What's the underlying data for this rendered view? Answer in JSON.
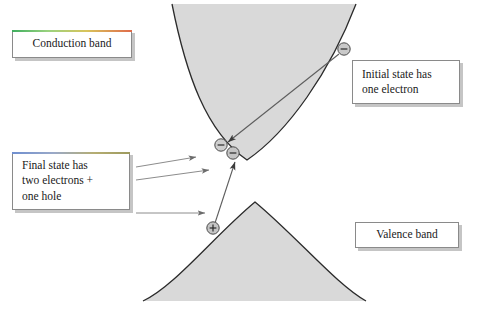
{
  "figure": {
    "kind": "semiconductor-band-diagram",
    "background_color": "#ffffff",
    "band_fill_color": "#d9d9d9",
    "band_line_color": "#2b2b2b",
    "arrow_color": "#6b6b6b",
    "transition_arrow_color": "#555555"
  },
  "callouts": {
    "conduction": {
      "label": "Conduction band",
      "accent_start": "#3fae5f",
      "accent_end": "#e06a4a"
    },
    "final_state": {
      "label": "Final state has\ntwo electrons +\none hole",
      "accent_start": "#6f8fd0",
      "accent_end": "#9d9a5e"
    },
    "initial_state": {
      "label": "Initial state has\none electron"
    },
    "valence": {
      "label": "Valence band"
    }
  },
  "particles": {
    "initial_electron": {
      "name": "electron",
      "charge_symbol": "−",
      "x": 344,
      "y": 49
    },
    "final_electron_1": {
      "name": "electron",
      "charge_symbol": "−",
      "x": 221,
      "y": 145
    },
    "final_electron_2": {
      "name": "electron",
      "charge_symbol": "−",
      "x": 233,
      "y": 153
    },
    "hole": {
      "name": "hole",
      "charge_symbol": "+",
      "x": 213,
      "y": 228
    }
  },
  "bands": {
    "conduction": {
      "type": "parabola-minimum",
      "vertex_x": 247,
      "vertex_y": 160,
      "left_top_x": 172,
      "right_top_x": 356,
      "top_y": 4
    },
    "valence": {
      "type": "parabola-maximum",
      "vertex_x": 255,
      "vertex_y": 202,
      "left_bottom_x": 143,
      "right_bottom_x": 366,
      "bottom_y": 301
    }
  },
  "arrows": {
    "relaxation": {
      "description": "initial electron to conduction band minimum",
      "from_x": 339,
      "from_y": 54,
      "to_x": 226,
      "to_y": 141
    },
    "excitation": {
      "description": "hole to second final electron",
      "from_x": 216,
      "from_y": 223,
      "to_x": 236,
      "to_y": 161
    },
    "pointer_electron_1": {
      "from_x": 136,
      "from_y": 167,
      "to_x": 196,
      "to_y": 157
    },
    "pointer_electron_2": {
      "from_x": 136,
      "from_y": 180,
      "to_x": 208,
      "to_y": 170
    },
    "pointer_hole": {
      "from_x": 136,
      "from_y": 213,
      "to_x": 205,
      "to_y": 213
    }
  }
}
